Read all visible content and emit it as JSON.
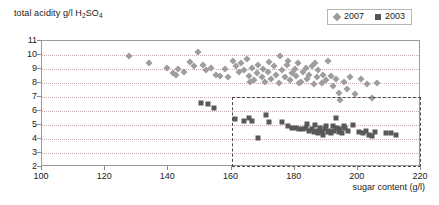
{
  "chart_data": {
    "type": "scatter",
    "title": "",
    "xlabel": "sugar content (g/l)",
    "ylabel": "total acidity g/l H2SO4",
    "ylabel_display": "total acidity g/l H",
    "ylabel_sub": "2",
    "ylabel_tail": "SO",
    "ylabel_sub2": "4",
    "xlim": [
      100,
      220
    ],
    "ylim": [
      2,
      11
    ],
    "xticks": [
      100,
      120,
      140,
      160,
      180,
      200,
      220
    ],
    "yticks": [
      2,
      3,
      4,
      5,
      6,
      7,
      8,
      9,
      10,
      11
    ],
    "grid": "horizontal-dotted",
    "legend_position": "top-right",
    "annotations": [
      {
        "type": "dashed-rectangle",
        "name": "highlight-region",
        "x_range": [
          160,
          220
        ],
        "y_range": [
          2,
          7
        ]
      }
    ],
    "series": [
      {
        "name": "2007",
        "marker": "diamond",
        "color": "#9d9d9d",
        "points": [
          [
            127.5,
            9.9
          ],
          [
            134.0,
            9.4
          ],
          [
            139.5,
            9.1
          ],
          [
            141.5,
            8.7
          ],
          [
            142.5,
            8.6
          ],
          [
            147.0,
            9.5
          ],
          [
            148.0,
            9.2
          ],
          [
            149.5,
            10.2
          ],
          [
            151.0,
            9.3
          ],
          [
            152.0,
            8.9
          ],
          [
            153.5,
            9.1
          ],
          [
            155.0,
            8.6
          ],
          [
            156.5,
            8.5
          ],
          [
            158.0,
            9.0
          ],
          [
            159.0,
            8.4
          ],
          [
            160.5,
            9.6
          ],
          [
            161.5,
            9.2
          ],
          [
            162.5,
            8.8
          ],
          [
            163.0,
            9.4
          ],
          [
            164.0,
            8.9
          ],
          [
            165.0,
            9.7
          ],
          [
            165.5,
            8.5
          ],
          [
            166.5,
            9.1
          ],
          [
            167.0,
            8.2
          ],
          [
            168.0,
            8.7
          ],
          [
            168.5,
            9.3
          ],
          [
            169.5,
            8.4
          ],
          [
            170.0,
            9.0
          ],
          [
            170.5,
            8.1
          ],
          [
            171.5,
            8.8
          ],
          [
            172.0,
            9.5
          ],
          [
            172.5,
            8.3
          ],
          [
            173.5,
            9.2
          ],
          [
            174.0,
            8.6
          ],
          [
            175.0,
            8.0
          ],
          [
            175.5,
            9.9
          ],
          [
            176.0,
            8.9
          ],
          [
            177.0,
            8.4
          ],
          [
            177.5,
            9.3
          ],
          [
            178.5,
            8.2
          ],
          [
            179.0,
            8.7
          ],
          [
            180.0,
            9.0
          ],
          [
            180.5,
            8.5
          ],
          [
            181.0,
            9.4
          ],
          [
            182.0,
            8.1
          ],
          [
            182.5,
            8.8
          ],
          [
            183.5,
            9.1
          ],
          [
            184.0,
            8.3
          ],
          [
            184.5,
            8.6
          ],
          [
            185.5,
            9.2
          ],
          [
            186.0,
            7.9
          ],
          [
            187.0,
            8.4
          ],
          [
            187.5,
            8.9
          ],
          [
            188.5,
            8.0
          ],
          [
            189.0,
            8.6
          ],
          [
            190.0,
            8.2
          ],
          [
            190.5,
            9.6
          ],
          [
            191.5,
            8.5
          ],
          [
            192.0,
            7.8
          ],
          [
            193.0,
            8.3
          ],
          [
            194.0,
            7.3
          ],
          [
            194.5,
            6.8
          ],
          [
            195.5,
            8.1
          ],
          [
            196.5,
            7.6
          ],
          [
            197.5,
            8.4
          ],
          [
            199.0,
            7.2
          ],
          [
            201.0,
            8.3
          ],
          [
            203.0,
            7.9
          ],
          [
            204.5,
            6.9
          ],
          [
            206.0,
            8.0
          ],
          [
            145.0,
            8.8
          ],
          [
            143.0,
            9.0
          ],
          [
            186.5,
            9.4
          ],
          [
            178.0,
            9.6
          ],
          [
            181.5,
            8.0
          ],
          [
            166.0,
            8.1
          ]
        ]
      },
      {
        "name": "2003",
        "marker": "square",
        "color": "#585858",
        "points": [
          [
            150.5,
            6.6
          ],
          [
            152.5,
            6.5
          ],
          [
            154.5,
            6.2
          ],
          [
            161.0,
            5.4
          ],
          [
            164.0,
            5.3
          ],
          [
            165.5,
            5.5
          ],
          [
            166.5,
            5.3
          ],
          [
            168.5,
            4.1
          ],
          [
            171.0,
            5.7
          ],
          [
            172.0,
            5.2
          ],
          [
            176.0,
            5.2
          ],
          [
            180.5,
            4.8
          ],
          [
            181.5,
            4.7
          ],
          [
            182.5,
            4.7
          ],
          [
            183.5,
            4.8
          ],
          [
            184.5,
            4.6
          ],
          [
            185.5,
            4.7
          ],
          [
            186.0,
            4.5
          ],
          [
            186.5,
            5.0
          ],
          [
            187.0,
            4.6
          ],
          [
            187.5,
            4.4
          ],
          [
            188.0,
            4.8
          ],
          [
            188.5,
            4.5
          ],
          [
            189.0,
            4.3
          ],
          [
            189.5,
            4.7
          ],
          [
            190.0,
            4.9
          ],
          [
            190.5,
            4.5
          ],
          [
            191.0,
            4.6
          ],
          [
            191.5,
            4.4
          ],
          [
            192.0,
            4.9
          ],
          [
            192.5,
            4.6
          ],
          [
            193.0,
            5.5
          ],
          [
            193.5,
            4.8
          ],
          [
            194.0,
            4.5
          ],
          [
            194.5,
            4.7
          ],
          [
            195.0,
            4.4
          ],
          [
            196.0,
            4.8
          ],
          [
            197.0,
            4.6
          ],
          [
            198.5,
            5.0
          ],
          [
            200.5,
            4.5
          ],
          [
            201.5,
            4.4
          ],
          [
            202.5,
            4.6
          ],
          [
            203.5,
            4.3
          ],
          [
            204.5,
            4.2
          ],
          [
            205.5,
            4.5
          ],
          [
            209.0,
            4.4
          ],
          [
            210.5,
            4.4
          ],
          [
            212.0,
            4.3
          ],
          [
            178.0,
            4.9
          ],
          [
            179.0,
            4.8
          ],
          [
            184.0,
            5.1
          ],
          [
            195.5,
            4.9
          ]
        ]
      }
    ]
  },
  "legend": {
    "items": [
      {
        "label": "2007",
        "marker": "diamond"
      },
      {
        "label": "2003",
        "marker": "square"
      }
    ]
  }
}
